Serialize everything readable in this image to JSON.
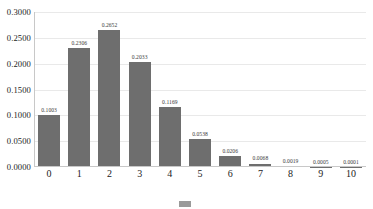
{
  "chart_data": {
    "type": "bar",
    "title": "",
    "subtitle": "",
    "xlabel": "",
    "ylabel": "",
    "categories": [
      "0",
      "1",
      "2",
      "3",
      "4",
      "5",
      "6",
      "7",
      "8",
      "9",
      "10"
    ],
    "values": [
      0.1003,
      0.2306,
      0.2652,
      0.2033,
      0.1169,
      0.0538,
      0.0206,
      0.0068,
      0.0019,
      0.0005,
      0.0001
    ],
    "value_labels": [
      "0.1003",
      "0.2306",
      "0.2652",
      "0.2033",
      "0.1169",
      "0.0538",
      "0.0206",
      "0.0068",
      "0.0019",
      "0.0005",
      "0.0001"
    ],
    "ylim": [
      0.0,
      0.3
    ],
    "ytick_values": [
      0.0,
      0.05,
      0.1,
      0.15,
      0.2,
      0.25,
      0.3
    ],
    "ytick_labels": [
      "0.0000",
      "0.0500",
      "0.1000",
      "0.1500",
      "0.2000",
      "0.2500",
      "0.3000"
    ],
    "grid": true,
    "grid_axis": "y",
    "legend_position": "bottom",
    "series": [
      {
        "name": "",
        "color": "#6e6e6e",
        "values": [
          0.1003,
          0.2306,
          0.2652,
          0.2033,
          0.1169,
          0.0538,
          0.0206,
          0.0068,
          0.0019,
          0.0005,
          0.0001
        ]
      }
    ]
  },
  "colors": {
    "bar": "#6e6e6e",
    "grid": "#e9e9e9",
    "axis": "#c8c8c8",
    "text": "#222222",
    "value_text": "#3a3a3a",
    "legend_swatch": "#9a9a9a"
  },
  "legend": {
    "label": ""
  }
}
